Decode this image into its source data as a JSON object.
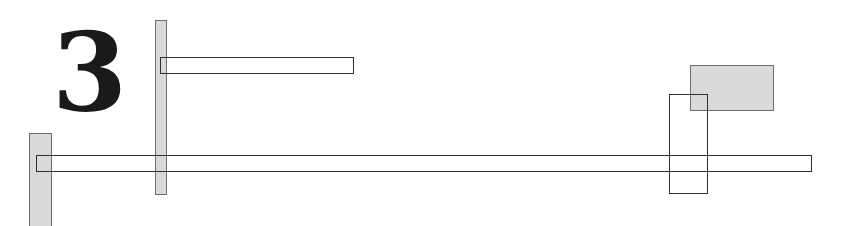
{
  "figure": {
    "label": "3",
    "colors": {
      "background": "#ffffff",
      "shaded_fill": "#d9d9d9",
      "shaded_border": "#6e6e6e",
      "outline": "#2f2f2f",
      "label": "#1a1a1a"
    },
    "shapes": [
      {
        "id": "left-shaded-bar",
        "type": "shaded",
        "x": 29,
        "y": 133,
        "w": 23,
        "h": 95
      },
      {
        "id": "center-shaded-bar",
        "type": "shaded",
        "x": 155,
        "y": 20,
        "w": 12,
        "h": 175
      },
      {
        "id": "top-outlined-bar",
        "type": "outlined",
        "x": 160,
        "y": 57,
        "w": 194,
        "h": 17
      },
      {
        "id": "long-outlined-bar",
        "type": "outlined",
        "x": 36,
        "y": 155,
        "w": 776,
        "h": 17
      },
      {
        "id": "right-shaded-box",
        "type": "shaded",
        "x": 690,
        "y": 65,
        "w": 84,
        "h": 46
      },
      {
        "id": "right-outlined-box",
        "type": "outlined",
        "x": 669,
        "y": 94,
        "w": 39,
        "h": 100
      }
    ]
  }
}
